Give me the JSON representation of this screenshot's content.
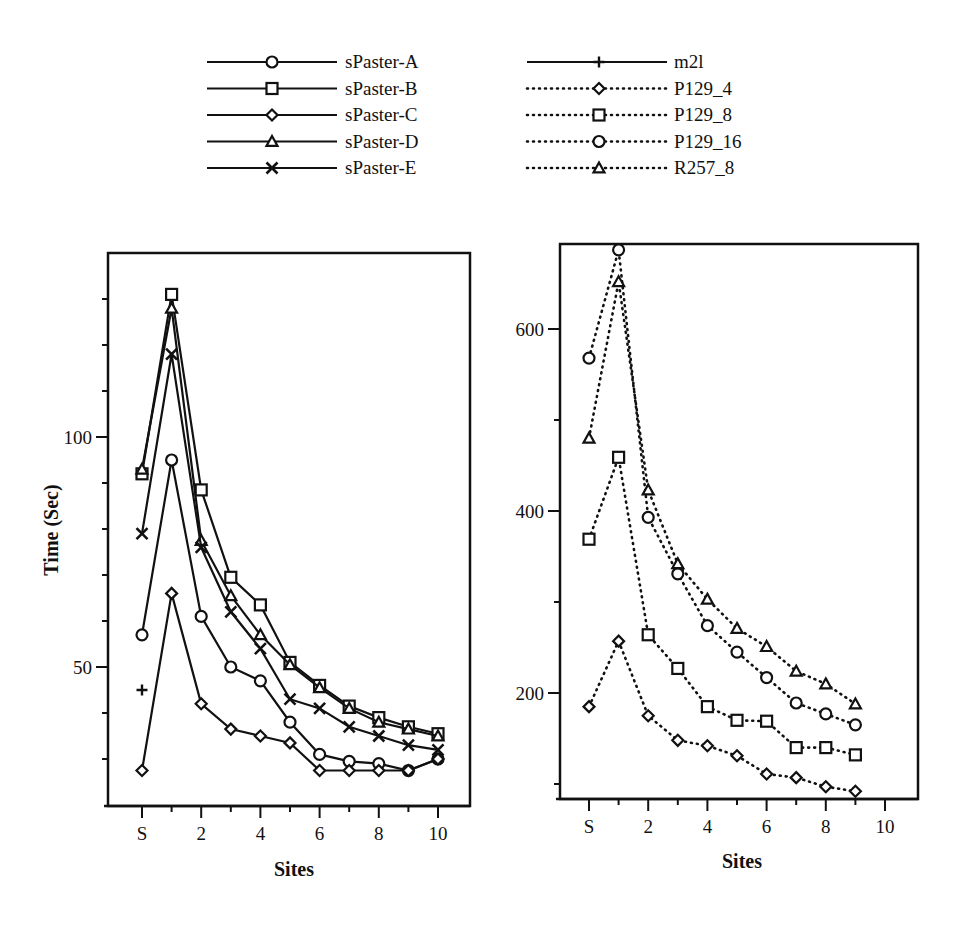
{
  "legend": {
    "left_column": [
      {
        "label": "sPaster-A",
        "marker": "circle",
        "line": "solid"
      },
      {
        "label": "sPaster-B",
        "marker": "square",
        "line": "solid"
      },
      {
        "label": "sPaster-C",
        "marker": "diamond",
        "line": "solid"
      },
      {
        "label": "sPaster-D",
        "marker": "triangle",
        "line": "solid"
      },
      {
        "label": "sPaster-E",
        "marker": "x",
        "line": "solid"
      }
    ],
    "right_column": [
      {
        "label": "m2l",
        "marker": "plus",
        "line": "solid"
      },
      {
        "label": "P129_4",
        "marker": "diamond",
        "line": "dotted"
      },
      {
        "label": "P129_8",
        "marker": "square",
        "line": "dotted"
      },
      {
        "label": "P129_16",
        "marker": "circle",
        "line": "dotted"
      },
      {
        "label": "R257_8",
        "marker": "triangle",
        "line": "dotted"
      }
    ]
  },
  "chart_data": [
    {
      "type": "line",
      "title": "",
      "xlabel": "Sites",
      "ylabel": "Time (Sec)",
      "x_categories": [
        "S",
        "1",
        "2",
        "3",
        "4",
        "5",
        "6",
        "7",
        "8",
        "9",
        "10"
      ],
      "x_tick_labels": [
        "S",
        "2",
        "4",
        "6",
        "8",
        "10"
      ],
      "y_tick_labels": [
        "50",
        "100"
      ],
      "ylim": [
        20,
        140
      ],
      "grid": false,
      "series": [
        {
          "name": "sPaster-A",
          "marker": "circle",
          "line": "solid",
          "values": [
            57,
            95,
            61,
            50,
            47,
            38,
            31,
            29.5,
            29,
            27.5,
            30
          ]
        },
        {
          "name": "sPaster-B",
          "marker": "square",
          "line": "solid",
          "values": [
            92,
            131,
            88.5,
            69.5,
            63.5,
            51,
            46,
            41.5,
            39,
            37,
            35.5
          ]
        },
        {
          "name": "sPaster-C",
          "marker": "diamond",
          "line": "solid",
          "values": [
            27.5,
            66,
            42,
            36.5,
            35,
            33.5,
            27.5,
            27.5,
            27.5,
            27.5,
            30
          ]
        },
        {
          "name": "sPaster-D",
          "marker": "triangle",
          "line": "solid",
          "values": [
            93,
            128,
            77.5,
            65.5,
            57,
            50.5,
            45.5,
            41,
            38,
            36.5,
            35
          ]
        },
        {
          "name": "sPaster-E",
          "marker": "x",
          "line": "solid",
          "values": [
            79,
            118,
            76,
            62,
            54,
            43,
            41,
            37,
            35,
            33,
            32
          ]
        },
        {
          "name": "m2l",
          "marker": "plus",
          "line": "none",
          "values": [
            45,
            null,
            null,
            null,
            null,
            null,
            null,
            null,
            null,
            null,
            null
          ]
        }
      ]
    },
    {
      "type": "line",
      "title": "",
      "xlabel": "Sites",
      "ylabel": "",
      "x_categories": [
        "S",
        "1",
        "2",
        "3",
        "4",
        "5",
        "6",
        "7",
        "8",
        "9",
        "10"
      ],
      "x_tick_labels": [
        "S",
        "2",
        "4",
        "6",
        "8",
        "10"
      ],
      "y_tick_labels": [
        "200",
        "400",
        "600"
      ],
      "ylim": [
        82,
        690
      ],
      "grid": false,
      "series": [
        {
          "name": "P129_4",
          "marker": "diamond",
          "line": "dotted",
          "values": [
            185,
            257,
            175,
            148,
            142,
            131,
            111,
            107,
            97,
            92
          ]
        },
        {
          "name": "P129_8",
          "marker": "square",
          "line": "dotted",
          "values": [
            369,
            459,
            264,
            227,
            185,
            170,
            169,
            140,
            140,
            132
          ]
        },
        {
          "name": "P129_16",
          "marker": "circle",
          "line": "dotted",
          "values": [
            568,
            687,
            393,
            331,
            274,
            245,
            217,
            189,
            177,
            165
          ]
        },
        {
          "name": "R257_8",
          "marker": "triangle",
          "line": "dotted",
          "values": [
            480,
            652,
            423,
            342,
            303,
            271,
            251,
            224,
            210,
            188
          ]
        }
      ]
    }
  ]
}
